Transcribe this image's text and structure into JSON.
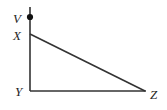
{
  "figure": {
    "kind": "geometry-diagram",
    "width": 167,
    "height": 110,
    "background_color": "#ffffff",
    "stroke_color": "#333333",
    "marker_color": "#111111",
    "label_color": "#262626",
    "stroke_width": 1.6
  },
  "points": [
    {
      "id": "V",
      "label": "V",
      "x": 30,
      "y": 17,
      "label_x": 13,
      "label_y": 23,
      "marker": "filled-dot",
      "marker_radius": 3.1
    },
    {
      "id": "X",
      "label": "X",
      "x": 30,
      "y": 34,
      "label_x": 13,
      "label_y": 40,
      "marker": "none",
      "marker_radius": 0
    },
    {
      "id": "Y",
      "label": "Y",
      "x": 30,
      "y": 91,
      "label_x": 15,
      "label_y": 96,
      "marker": "none",
      "marker_radius": 0
    },
    {
      "id": "Z",
      "label": "Z",
      "x": 145,
      "y": 91,
      "label_x": 150,
      "label_y": 99,
      "marker": "none",
      "marker_radius": 0
    }
  ],
  "segments": [
    {
      "id": "VY",
      "name": "vertical-segment-v-to-y",
      "x1": 30,
      "y1": 7,
      "x2": 30,
      "y2": 91
    },
    {
      "id": "XZ",
      "name": "hypotenuse-x-to-z",
      "x1": 30,
      "y1": 34,
      "x2": 145,
      "y2": 91
    },
    {
      "id": "YZ",
      "name": "base-y-to-z",
      "x1": 30,
      "y1": 91,
      "x2": 146,
      "y2": 91
    }
  ]
}
